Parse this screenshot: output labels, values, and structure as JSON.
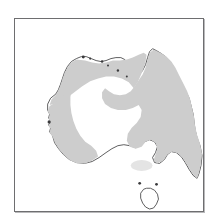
{
  "figure": {
    "kind": "distribution-map",
    "region": "Australia",
    "frame": {
      "border_color": "#6e6e70",
      "shadow_color": "#b9b9bb",
      "background": "#ffffff",
      "x": 14,
      "y": 18,
      "width": 190,
      "height": 194
    },
    "legend_items": [
      {
        "key": "range",
        "label": "Shaded distribution range",
        "color": "#cdcdcd"
      },
      {
        "key": "range_faint",
        "label": "Faint outlying patch",
        "color": "#e4e4e4"
      },
      {
        "key": "absent",
        "label": "Unshaded (absent) interior and Tasmania",
        "color": "#ffffff"
      },
      {
        "key": "coastline",
        "label": "Coastline outline",
        "color": "#4a4a4c"
      }
    ],
    "landmasses": [
      {
        "name": "mainland-australia",
        "shaded": true
      },
      {
        "name": "tasmania",
        "shaded": false
      }
    ],
    "shaded_areas": [
      {
        "name": "northern-top-end-and-kimberley",
        "shaded": true
      },
      {
        "name": "eastern-seaboard-queensland-nsw",
        "shaded": true
      },
      {
        "name": "southwest-western-australia-coastal-belt",
        "shaded": true
      },
      {
        "name": "victoria-faint-patch",
        "shaded": true
      }
    ],
    "unshaded_areas": [
      {
        "name": "central-arid-interior"
      },
      {
        "name": "gulf-country-gap"
      },
      {
        "name": "tasmania"
      }
    ],
    "caption": ""
  }
}
